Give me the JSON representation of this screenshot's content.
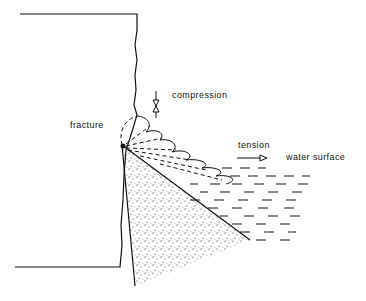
{
  "diagram": {
    "labels": {
      "compression": "compression",
      "fracture": "fracture",
      "tension": "tension",
      "water_surface": "water surface"
    },
    "colors": {
      "ink": "#111111",
      "background": "#ffffff"
    }
  }
}
